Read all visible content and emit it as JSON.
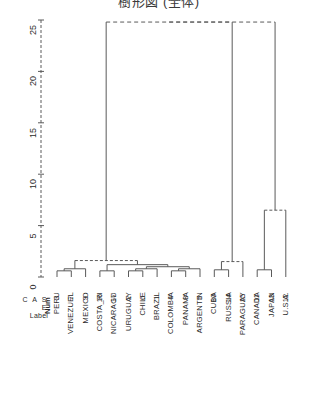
{
  "title": "樹形図 (全体)",
  "axis": {
    "ticks": [
      {
        "value": 0,
        "label": "0"
      },
      {
        "value": 5,
        "label": "5"
      },
      {
        "value": 10,
        "label": "10"
      },
      {
        "value": 15,
        "label": "15"
      },
      {
        "value": 20,
        "label": "20"
      },
      {
        "value": 25,
        "label": "25"
      }
    ],
    "min": 0,
    "max": 25
  },
  "header": {
    "case_word": "C A S E",
    "label_word": "Label",
    "num_word": "Num"
  },
  "leaves": [
    {
      "label": "PERU",
      "num": "3"
    },
    {
      "label": "VENEZUEL",
      "num": "7"
    },
    {
      "label": "MEXICO",
      "num": "9"
    },
    {
      "label": "COSTA_RI",
      "num": "16"
    },
    {
      "label": "NICARAGU",
      "num": "17"
    },
    {
      "label": "URUGUAY",
      "num": "2"
    },
    {
      "label": "CHILE",
      "num": "6"
    },
    {
      "label": "BRAZIL",
      "num": "1"
    },
    {
      "label": "COLOMBIA",
      "num": "4"
    },
    {
      "label": "PANAMA",
      "num": "8"
    },
    {
      "label": "ARGENTIN",
      "num": "5"
    },
    {
      "label": "CUBA",
      "num": "10"
    },
    {
      "label": "RUSSIA",
      "num": "14"
    },
    {
      "label": "PARAGUAY",
      "num": "15"
    },
    {
      "label": "CANADA",
      "num": "11"
    },
    {
      "label": "JAPAN",
      "num": "13"
    },
    {
      "label": "U.S.A.",
      "num": "12"
    }
  ],
  "chart_data": {
    "type": "dendrogram",
    "title": "樹形図 (全体)",
    "orientation": "vertical",
    "ylabel": "",
    "xlabel": "",
    "ylim": [
      0,
      25
    ],
    "grid": false,
    "leaf_labels": [
      "PERU",
      "VENEZUEL",
      "MEXICO",
      "COSTA_RI",
      "NICARAGU",
      "URUGUAY",
      "CHILE",
      "BRAZIL",
      "COLOMBIA",
      "PANAMA",
      "ARGENTIN",
      "CUBA",
      "RUSSIA",
      "PARAGUAY",
      "CANADA",
      "JAPAN",
      "U.S.A."
    ],
    "leaf_numbers": [
      3,
      7,
      9,
      16,
      17,
      2,
      6,
      1,
      4,
      8,
      5,
      10,
      14,
      15,
      11,
      13,
      12
    ],
    "merges": [
      {
        "id": "m1",
        "children": [
          "leaf:0",
          "leaf:1"
        ],
        "height": 0.6
      },
      {
        "id": "m2",
        "children": [
          "m1",
          "leaf:2"
        ],
        "height": 0.8
      },
      {
        "id": "m3",
        "children": [
          "leaf:3",
          "leaf:4"
        ],
        "height": 0.6
      },
      {
        "id": "m4",
        "children": [
          "leaf:5",
          "leaf:6"
        ],
        "height": 0.6
      },
      {
        "id": "m5",
        "children": [
          "m4",
          "leaf:7"
        ],
        "height": 0.8
      },
      {
        "id": "m6",
        "children": [
          "leaf:8",
          "leaf:9"
        ],
        "height": 0.6
      },
      {
        "id": "m7",
        "children": [
          "m6",
          "leaf:10"
        ],
        "height": 0.8
      },
      {
        "id": "m8",
        "children": [
          "m5",
          "m7"
        ],
        "height": 1.0
      },
      {
        "id": "m9",
        "children": [
          "m3",
          "m8"
        ],
        "height": 1.2
      },
      {
        "id": "m10",
        "children": [
          "m2",
          "m9"
        ],
        "height": 1.6
      },
      {
        "id": "m11",
        "children": [
          "leaf:11",
          "leaf:12"
        ],
        "height": 0.7
      },
      {
        "id": "m12",
        "children": [
          "m11",
          "leaf:13"
        ],
        "height": 1.5
      },
      {
        "id": "m13",
        "children": [
          "leaf:14",
          "leaf:15"
        ],
        "height": 0.7
      },
      {
        "id": "m14",
        "children": [
          "m13",
          "leaf:16"
        ],
        "height": 6.5
      },
      {
        "id": "m15",
        "children": [
          "m10",
          "m12"
        ],
        "height": 24.8
      },
      {
        "id": "m16",
        "children": [
          "m15",
          "m14"
        ],
        "height": 24.8
      }
    ]
  }
}
